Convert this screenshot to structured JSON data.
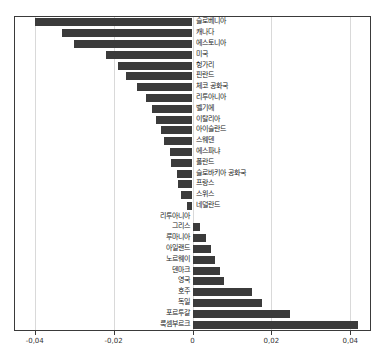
{
  "chart_data": {
    "type": "bar",
    "orientation": "horizontal",
    "title": "",
    "subtitle": "",
    "xlabel": "",
    "ylabel": "",
    "xlim": [
      -0.045,
      0.045
    ],
    "grid": true,
    "grid_axis": "x",
    "legend": null,
    "bar_color": "#3b3b3b",
    "decimal_separator": ",",
    "xticks": [
      -0.04,
      -0.02,
      0,
      0.02,
      0.04
    ],
    "xticklabels": [
      "-0,04",
      "-0,02",
      "0",
      "0,02",
      "0,04"
    ],
    "categories": [
      "슬로베니아",
      "캐나다",
      "에스토니아",
      "미국",
      "헝가리",
      "핀란드",
      "체코 공화국",
      "리투아니아",
      "벨기에",
      "이탈리아",
      "아이슬란드",
      "스웨덴",
      "에스파냐",
      "폴란드",
      "슬로바키아 공화국",
      "프랑스",
      "스위스",
      "네덜란드",
      "리투아니아",
      "그리스",
      "루마니아",
      "아일랜드",
      "노르웨이",
      "덴마크",
      "영국",
      "호주",
      "독일",
      "포르투갈",
      "룩셈부르크"
    ],
    "values": [
      -0.04,
      -0.033,
      -0.03,
      -0.022,
      -0.019,
      -0.0168,
      -0.014,
      -0.0118,
      -0.0103,
      -0.0092,
      -0.008,
      -0.0072,
      -0.0058,
      -0.0055,
      -0.004,
      -0.0038,
      -0.003,
      -0.0013,
      0.0,
      0.0018,
      0.0033,
      0.0048,
      0.0058,
      0.007,
      0.008,
      0.015,
      0.0175,
      0.0248,
      0.042
    ]
  }
}
